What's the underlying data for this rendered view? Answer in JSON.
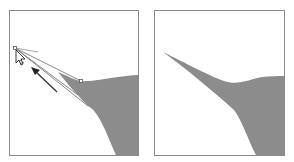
{
  "figure": {
    "colors": {
      "shape_fill": "#8c8c8c",
      "frame_stroke": "#8a8a8a",
      "path_stroke": "#6a6a6a",
      "arrow": "#333333",
      "background": "#ffffff"
    },
    "panels": [
      {
        "id": "before",
        "label": "Dragging anchor point with direct selection cursor",
        "elements": [
          "shape",
          "selected-path-outline",
          "anchor-point",
          "direction-handle",
          "drag-arrow",
          "direct-selection-cursor"
        ]
      },
      {
        "id": "after",
        "label": "Result: shape extended to a sharp point",
        "elements": [
          "shape"
        ]
      }
    ]
  }
}
